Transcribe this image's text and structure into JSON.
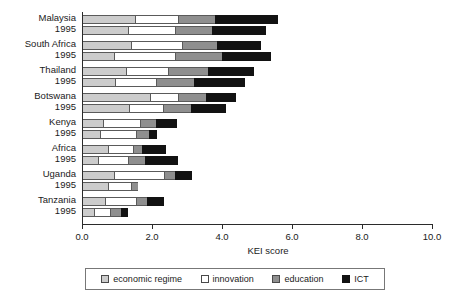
{
  "chart_data": {
    "type": "bar",
    "orientation": "horizontal",
    "stacked": true,
    "title": "",
    "xlabel": "KEI score",
    "ylabel": "",
    "xlim": [
      0.0,
      10.0
    ],
    "xticks": [
      "0.0",
      "2.0",
      "4.0",
      "6.0",
      "8.0",
      "10.0"
    ],
    "xtick_values": [
      0.0,
      2.0,
      4.0,
      6.0,
      8.0,
      10.0
    ],
    "grid": false,
    "legend_position": "bottom",
    "series": [
      {
        "name": "economic regime",
        "color": "#cccccc"
      },
      {
        "name": "innovation",
        "color": "#ffffff"
      },
      {
        "name": "education",
        "color": "#8f8f8f"
      },
      {
        "name": "ICT",
        "color": "#121212"
      }
    ],
    "categories": [
      "Malaysia",
      "South Africa",
      "Thailand",
      "Botswana",
      "Kenya",
      "Africa",
      "Uganda",
      "Tanzania"
    ],
    "year_label": "1995",
    "groups": [
      {
        "name": "Malaysia",
        "year_label": "1995",
        "bars": [
          {
            "period": "recent",
            "values": [
              1.5,
              1.25,
              1.05,
              1.8
            ],
            "total": 5.6
          },
          {
            "period": "1995",
            "values": [
              1.3,
              1.35,
              1.05,
              1.55
            ],
            "total": 5.25
          }
        ]
      },
      {
        "name": "South Africa",
        "year_label": "1995",
        "bars": [
          {
            "period": "recent",
            "values": [
              1.4,
              1.45,
              1.0,
              1.25
            ],
            "total": 5.1
          },
          {
            "period": "1995",
            "values": [
              0.9,
              1.75,
              1.35,
              1.4
            ],
            "total": 5.4
          }
        ]
      },
      {
        "name": "Thailand",
        "year_label": "1995",
        "bars": [
          {
            "period": "recent",
            "values": [
              1.25,
              1.2,
              1.15,
              1.3
            ],
            "total": 4.9
          },
          {
            "period": "1995",
            "values": [
              0.95,
              1.15,
              1.1,
              1.45
            ],
            "total": 4.65
          }
        ]
      },
      {
        "name": "Botswana",
        "year_label": "1995",
        "bars": [
          {
            "period": "recent",
            "values": [
              1.95,
              0.8,
              0.8,
              0.85
            ],
            "total": 4.4
          },
          {
            "period": "1995",
            "values": [
              1.35,
              0.95,
              0.8,
              1.0
            ],
            "total": 4.1
          }
        ]
      },
      {
        "name": "Kenya",
        "year_label": "1995",
        "bars": [
          {
            "period": "recent",
            "values": [
              0.6,
              1.05,
              0.45,
              0.6
            ],
            "total": 2.7
          },
          {
            "period": "1995",
            "values": [
              0.5,
              1.05,
              0.35,
              0.25
            ],
            "total": 2.15
          }
        ]
      },
      {
        "name": "Africa",
        "year_label": "1995",
        "bars": [
          {
            "period": "recent",
            "values": [
              0.75,
              0.7,
              0.25,
              0.7
            ],
            "total": 2.4
          },
          {
            "period": "1995",
            "values": [
              0.45,
              0.85,
              0.5,
              0.95
            ],
            "total": 2.75
          }
        ]
      },
      {
        "name": "Uganda",
        "year_label": "1995",
        "bars": [
          {
            "period": "recent",
            "values": [
              0.9,
              1.45,
              0.3,
              0.5
            ],
            "total": 3.15
          },
          {
            "period": "1995",
            "values": [
              0.75,
              0.65,
              0.2,
              0.0
            ],
            "total": 1.6
          }
        ]
      },
      {
        "name": "Tanzania",
        "year_label": "1995",
        "bars": [
          {
            "period": "recent",
            "values": [
              0.65,
              0.9,
              0.3,
              0.5
            ],
            "total": 2.35
          },
          {
            "period": "1995",
            "values": [
              0.35,
              0.45,
              0.3,
              0.2
            ],
            "total": 1.3
          }
        ]
      }
    ]
  },
  "axis": {
    "x_title": "KEI score",
    "ticks": [
      "0.0",
      "2.0",
      "4.0",
      "6.0",
      "8.0",
      "10.0"
    ]
  },
  "legend": {
    "items": [
      {
        "label": "economic regime",
        "key": "economic_regime"
      },
      {
        "label": "innovation",
        "key": "innovation"
      },
      {
        "label": "education",
        "key": "education"
      },
      {
        "label": "ICT",
        "key": "ict"
      }
    ]
  }
}
